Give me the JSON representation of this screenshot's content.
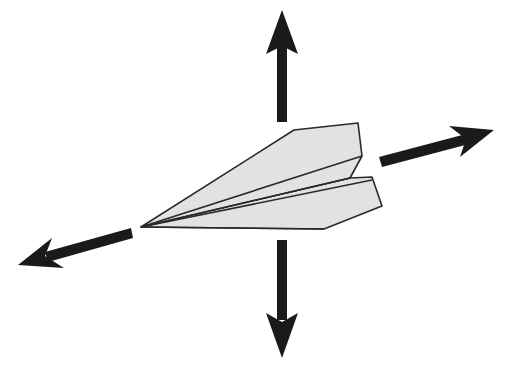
{
  "diagram": {
    "colors": {
      "background": "#ffffff",
      "plane_fill": "#e2e2e2",
      "plane_stroke": "#2a2a2a",
      "arrow": "#1a1a1a"
    },
    "arrows": [
      {
        "name": "up",
        "direction": "up"
      },
      {
        "name": "down",
        "direction": "down"
      },
      {
        "name": "forward",
        "direction": "right-up"
      },
      {
        "name": "backward",
        "direction": "left-down"
      }
    ]
  }
}
